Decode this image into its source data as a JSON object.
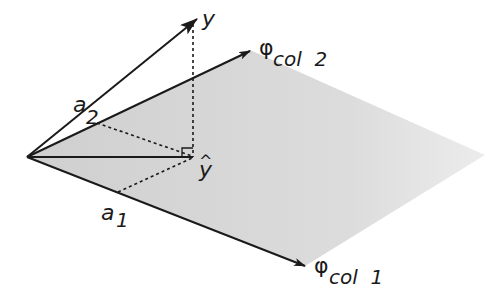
{
  "diagram": {
    "labels": {
      "y": "y",
      "y_hat": "ŷ",
      "y_hat_base": "y",
      "hat": "^",
      "phi_col2_symbol": "φ",
      "phi_col2_sub": "col  2",
      "phi_col1_symbol": "φ",
      "phi_col1_sub": "col  1",
      "a2_base": "a",
      "a2_sub": "2",
      "a1_base": "a",
      "a1_sub": "1"
    },
    "colors": {
      "ink": "#1a1a1a",
      "plane": "#d9d9d9"
    }
  }
}
